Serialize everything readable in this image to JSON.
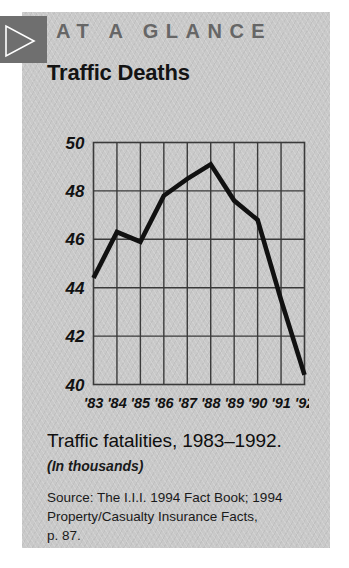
{
  "card": {
    "background_color": "#c9c9c9"
  },
  "header": {
    "mark_icon": "play-triangle-icon",
    "mark_bg_color": "#6f6f6f",
    "title": "AT A GLANCE",
    "title_color": "#666666"
  },
  "chart_data": {
    "type": "line",
    "title": "Traffic Deaths",
    "xlabel": "",
    "ylabel": "",
    "categories": [
      "'83",
      "'84",
      "'85",
      "'86",
      "'87",
      "'88",
      "'89",
      "'90",
      "'91",
      "'92"
    ],
    "values": [
      44.4,
      46.3,
      45.9,
      47.8,
      48.5,
      49.1,
      47.6,
      46.8,
      43.5,
      40.4
    ],
    "series": [
      {
        "name": "Traffic fatalities",
        "values": [
          44.4,
          46.3,
          45.9,
          47.8,
          48.5,
          49.1,
          47.6,
          46.8,
          43.5,
          40.4
        ]
      }
    ],
    "ylim": [
      40,
      50
    ],
    "yticks": [
      40,
      42,
      44,
      46,
      48,
      50
    ],
    "ytick_labels": [
      "40",
      "42",
      "44",
      "46",
      "48",
      "50"
    ],
    "xtick_labels": [
      "'83",
      "'84",
      "'85",
      "'86",
      "'87",
      "'88",
      "'89",
      "'90",
      "'91",
      "'92"
    ],
    "grid": true,
    "legend": "none",
    "line_color": "#111111",
    "grid_color": "#3a3a3a",
    "units": "thousands"
  },
  "caption": {
    "main": "Traffic fatalities, 1983–1992.",
    "sub": "(In thousands)"
  },
  "source": {
    "line1": "Source: The I.I.I. 1994 Fact Book; 1994",
    "line2": "Property/Casualty Insurance Facts,",
    "line3": "p. 87."
  }
}
